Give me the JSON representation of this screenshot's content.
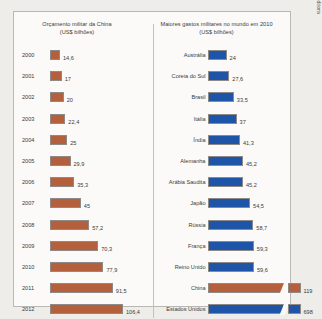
{
  "credit": "Allmaps/Arquivo da editora",
  "colors": {
    "orange": "#b5603c",
    "blue": "#1f55a8",
    "panel_bg": "#fbfaf8",
    "page_bg": "#efedea",
    "border": "#b9b7b4"
  },
  "chart_data": [
    {
      "type": "bar",
      "orientation": "horizontal",
      "title": "Orçamento militar da China",
      "subtitle": "(US$ bilhões)",
      "xlabel": "",
      "ylabel": "",
      "unit": "US$ bilhões",
      "series_color": "#b5603c",
      "grid": false,
      "legend": "none",
      "xlim": [
        0,
        106.4
      ],
      "categories": [
        "2000",
        "2001",
        "2002",
        "2003",
        "2004",
        "2005",
        "2006",
        "2007",
        "2008",
        "2009",
        "2010",
        "2011",
        "2012"
      ],
      "values": [
        14.6,
        17,
        20,
        22.4,
        25,
        29.9,
        35.3,
        45,
        57.2,
        70.3,
        77.9,
        91.5,
        106.4
      ],
      "value_labels": [
        "14,6",
        "17",
        "20",
        "22,4",
        "25",
        "29,9",
        "35,3",
        "45",
        "57,2",
        "70,3",
        "77,9",
        "91,5",
        "106,4"
      ]
    },
    {
      "type": "bar",
      "orientation": "horizontal",
      "title": "Maiores gastos militares no mundo em 2010",
      "subtitle": "(US$ bilhões)",
      "xlabel": "",
      "ylabel": "",
      "unit": "US$ bilhões",
      "series_color": "#1f55a8",
      "grid": false,
      "legend": "none",
      "axis_break": true,
      "xlim": [
        0,
        698
      ],
      "categories": [
        "Austrália",
        "Coreia do Sul",
        "Brasil",
        "Itália",
        "Índia",
        "Alemanha",
        "Arábia Saudita",
        "Japão",
        "Rússia",
        "França",
        "Reino Unido",
        "China",
        "Estados Unidos"
      ],
      "values": [
        24,
        27.6,
        33.5,
        37,
        41.3,
        45.2,
        45.2,
        54.5,
        58.7,
        59.3,
        59.6,
        119,
        698
      ],
      "value_labels": [
        "24",
        "27,6",
        "33,5",
        "37",
        "41,3",
        "45,2",
        "45,2",
        "54,5",
        "58,7",
        "59,3",
        "59,6",
        "119",
        "698"
      ],
      "bar_colors": [
        "#1f55a8",
        "#1f55a8",
        "#1f55a8",
        "#1f55a8",
        "#1f55a8",
        "#1f55a8",
        "#1f55a8",
        "#1f55a8",
        "#1f55a8",
        "#1f55a8",
        "#1f55a8",
        "#b5603c",
        "#1f55a8"
      ]
    }
  ]
}
